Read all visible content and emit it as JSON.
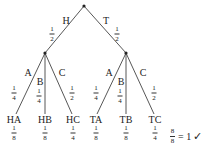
{
  "tree": {
    "level1": [
      {
        "edge": "H",
        "prob_num": "1",
        "prob_den": "2"
      },
      {
        "edge": "T",
        "prob_num": "1",
        "prob_den": "2"
      }
    ],
    "level2": [
      {
        "edge": "A",
        "prob_num": "1",
        "prob_den": "4"
      },
      {
        "edge": "B",
        "prob_num": "1",
        "prob_den": "4"
      },
      {
        "edge": "C",
        "prob_num": "1",
        "prob_den": "2"
      },
      {
        "edge": "A",
        "prob_num": "1",
        "prob_den": "4"
      },
      {
        "edge": "B",
        "prob_num": "1",
        "prob_den": "4"
      },
      {
        "edge": "C",
        "prob_num": "1",
        "prob_den": "2"
      }
    ],
    "leaves": [
      {
        "label": "HA",
        "num": "1",
        "den": "8"
      },
      {
        "label": "HB",
        "num": "1",
        "den": "8"
      },
      {
        "label": "HC",
        "num": "1",
        "den": "4"
      },
      {
        "label": "TA",
        "num": "1",
        "den": "8"
      },
      {
        "label": "TB",
        "num": "1",
        "den": "8"
      },
      {
        "label": "TC",
        "num": "1",
        "den": "4"
      }
    ],
    "total": {
      "num": "8",
      "den": "8",
      "equals": "= 1",
      "check": "✓"
    }
  }
}
